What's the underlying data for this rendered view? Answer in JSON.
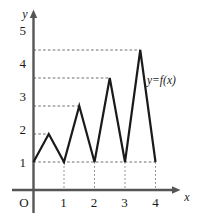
{
  "chart_data": {
    "type": "line",
    "title": "",
    "subtitle": "",
    "xlabel": "x",
    "ylabel": "y",
    "xlim": [
      0,
      4.35
    ],
    "ylim": [
      0,
      5.6
    ],
    "xticks": [
      "1",
      "2",
      "3",
      "4"
    ],
    "xtick_values": [
      1,
      2,
      3,
      4
    ],
    "yticks": [
      "1",
      "2",
      "3",
      "4",
      "5"
    ],
    "ytick_values": [
      1,
      2,
      3,
      4,
      5
    ],
    "origin_label": "O",
    "grid": "dashed guide lines from each y tick to the corresponding peak, and dotted drop lines from the x ticks up to y=1",
    "legend": "none",
    "annotations": [
      {
        "text": "y=f(x)",
        "x": 3.72,
        "y": 3.35
      }
    ],
    "series": [
      {
        "name": "y=f(x)",
        "color": "#1a1a1a",
        "x": [
          0,
          0.5,
          1,
          1.5,
          2,
          2.5,
          3,
          3.5,
          4
        ],
        "y": [
          1,
          2,
          1,
          3,
          1,
          4,
          1,
          5,
          1
        ]
      }
    ]
  },
  "axes": {
    "y_axis_name": "y",
    "x_axis_name": "x",
    "origin": "O"
  },
  "curve": {
    "label": "y=f(x)"
  },
  "colors": {
    "curve": "#1a1a1a",
    "axis": "#555555",
    "guide": "#777777",
    "background": "#ffffff"
  }
}
